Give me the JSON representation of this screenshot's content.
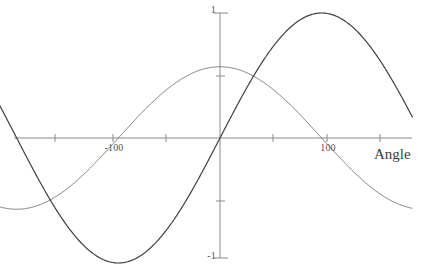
{
  "chart_data": {
    "type": "line",
    "title": "",
    "xlabel": "Angle",
    "ylabel": "",
    "xlim": [
      -212,
      180
    ],
    "ylim": [
      -1,
      1
    ],
    "grid": false,
    "legend": "none",
    "x_ticks": [
      -150,
      -100,
      -50,
      0,
      50,
      100,
      150
    ],
    "x_tick_labels_shown": [
      "-100",
      "100"
    ],
    "y_ticks": [
      -1,
      -0.5,
      0.5,
      1
    ],
    "y_tick_labels_shown": [
      "1",
      "-1"
    ],
    "series": [
      {
        "name": "sine-curve",
        "color": "#3f3f3f",
        "line_width": 1.2,
        "amplitude": 1.0,
        "period": 380,
        "phase_deg": 0,
        "form": "y = sin(360*x/380)",
        "key_points": [
          {
            "x": -212,
            "y": -0.05
          },
          {
            "x": -190,
            "y": -0.3
          },
          {
            "x": -95,
            "y": -1.0
          },
          {
            "x": 0,
            "y": 0.0
          },
          {
            "x": 95,
            "y": 1.0
          },
          {
            "x": 180,
            "y": -0.1
          }
        ]
      },
      {
        "name": "cosine-curve",
        "color": "#7a7a7a",
        "line_width": 1.0,
        "amplitude": 0.57,
        "period": 380,
        "phase_deg": 90,
        "form": "y = 0.57*cos(360*x/380)",
        "key_points": [
          {
            "x": -212,
            "y": 0.52
          },
          {
            "x": -190,
            "y": 0.57
          },
          {
            "x": -95,
            "y": -0.57
          },
          {
            "x": 0,
            "y": 0.57
          },
          {
            "x": 105,
            "y": -0.57
          },
          {
            "x": 180,
            "y": 0.45
          }
        ]
      }
    ]
  },
  "axes": {
    "x_axis_label": "Angle",
    "tick_labels": {
      "x_neg_100": "-100",
      "x_pos_100": "100",
      "y_top": "1",
      "y_bottom": "-1"
    }
  },
  "colors": {
    "background": "#ffffff",
    "axis": "#8a8a8a",
    "dark_curve": "#3f3f3f",
    "light_curve": "#7a7a7a",
    "text": "#555555"
  }
}
